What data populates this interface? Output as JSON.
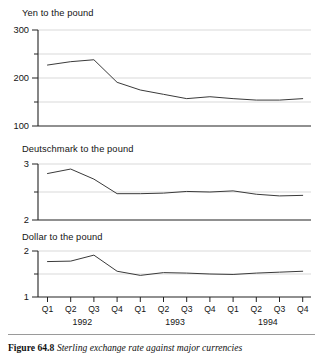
{
  "figure": {
    "caption_label": "Figure 64.8",
    "caption_text": "Sterling exchange rate against major currencies"
  },
  "axis": {
    "quarter_labels": [
      "Q1",
      "Q2",
      "Q3",
      "Q4",
      "Q1",
      "Q2",
      "Q3",
      "Q4",
      "Q1",
      "Q2",
      "Q3",
      "Q4"
    ],
    "year_labels": [
      "1992",
      "1993",
      "1994"
    ]
  },
  "panels": {
    "yen": {
      "title": "Yen to the pound",
      "ytick_labels": [
        "300",
        "200",
        "100"
      ]
    },
    "deutschmark": {
      "title": "Deutschmark to the pound",
      "ytick_labels": [
        "3",
        "2"
      ]
    },
    "dollar": {
      "title": "Dollar to the pound",
      "ytick_labels": [
        "2",
        "1"
      ]
    }
  },
  "chart_data": [
    {
      "type": "line",
      "title": "Yen to the pound",
      "xlabel": "",
      "ylabel": "Yen to the pound",
      "categories": [
        "Q1 1992",
        "Q2 1992",
        "Q3 1992",
        "Q4 1992",
        "Q1 1993",
        "Q2 1993",
        "Q3 1993",
        "Q4 1993",
        "Q1 1994",
        "Q2 1994",
        "Q3 1994",
        "Q4 1994"
      ],
      "values": [
        227,
        234,
        238,
        191,
        175,
        166,
        157,
        161,
        157,
        154,
        154,
        157
      ],
      "ylim": [
        100,
        300
      ],
      "yticks": [
        100,
        200,
        300
      ],
      "yminorticks": [
        150,
        250
      ],
      "grid": true,
      "legend": "none"
    },
    {
      "type": "line",
      "title": "Deutschmark to the pound",
      "xlabel": "",
      "ylabel": "Deutschmark to the pound",
      "categories": [
        "Q1 1992",
        "Q2 1992",
        "Q3 1992",
        "Q4 1992",
        "Q1 1993",
        "Q2 1993",
        "Q3 1993",
        "Q4 1993",
        "Q1 1994",
        "Q2 1994",
        "Q3 1994",
        "Q4 1994"
      ],
      "values": [
        2.83,
        2.91,
        2.73,
        2.47,
        2.47,
        2.48,
        2.51,
        2.5,
        2.52,
        2.46,
        2.43,
        2.44
      ],
      "ylim": [
        2,
        3
      ],
      "yticks": [
        2,
        3
      ],
      "yminorticks": [
        2.5
      ],
      "grid": true,
      "legend": "none"
    },
    {
      "type": "line",
      "title": "Dollar to the pound",
      "xlabel": "",
      "ylabel": "Dollar to the pound",
      "categories": [
        "Q1 1992",
        "Q2 1992",
        "Q3 1992",
        "Q4 1992",
        "Q1 1993",
        "Q2 1993",
        "Q3 1993",
        "Q4 1993",
        "Q1 1994",
        "Q2 1994",
        "Q3 1994",
        "Q4 1994"
      ],
      "values": [
        1.77,
        1.78,
        1.91,
        1.56,
        1.47,
        1.53,
        1.52,
        1.5,
        1.49,
        1.52,
        1.54,
        1.56
      ],
      "ylim": [
        1,
        2
      ],
      "yticks": [
        1,
        2
      ],
      "yminorticks": [
        1.5
      ],
      "grid": true,
      "legend": "none"
    }
  ]
}
